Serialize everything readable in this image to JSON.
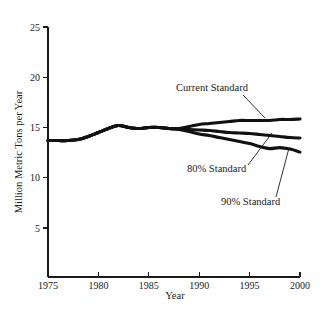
{
  "chart_data": {
    "type": "line",
    "title": "",
    "xlabel": "Year",
    "ylabel": "Million Metric Tons per Year",
    "xlim": [
      1975,
      2000
    ],
    "ylim": [
      0,
      25
    ],
    "grid": false,
    "legend_position": "inline-annotations",
    "x_ticks": [
      1975,
      1980,
      1985,
      1990,
      1995,
      2000
    ],
    "x_tick_labels": [
      "1975",
      "1980",
      "1985",
      "1990",
      "1995",
      "2000"
    ],
    "y_ticks": [
      5,
      10,
      15,
      20,
      25
    ],
    "y_tick_labels": [
      "5",
      "10",
      "15",
      "20",
      "25"
    ],
    "x": [
      1975,
      1976,
      1977,
      1978,
      1979,
      1980,
      1981,
      1982,
      1983,
      1984,
      1985,
      1986,
      1987,
      1988,
      1989,
      1990,
      1991,
      1992,
      1993,
      1994,
      1995,
      1996,
      1997,
      1998,
      1999,
      2000
    ],
    "series": [
      {
        "name": "Current Standard",
        "label": "Current Standard",
        "values": [
          13.7,
          13.7,
          13.7,
          13.8,
          14.1,
          14.5,
          14.9,
          15.2,
          15.0,
          14.9,
          15.0,
          15.0,
          14.9,
          14.9,
          15.1,
          15.3,
          15.4,
          15.5,
          15.6,
          15.7,
          15.7,
          15.7,
          15.7,
          15.8,
          15.8,
          15.85
        ]
      },
      {
        "name": "80% Standard",
        "label": "80% Standard",
        "values": [
          13.7,
          13.7,
          13.7,
          13.8,
          14.1,
          14.5,
          14.9,
          15.2,
          15.0,
          14.9,
          15.0,
          15.0,
          14.9,
          14.85,
          14.8,
          14.75,
          14.7,
          14.6,
          14.5,
          14.45,
          14.4,
          14.3,
          14.2,
          14.1,
          14.0,
          13.95
        ]
      },
      {
        "name": "90% Standard",
        "label": "90% Standard",
        "values": [
          13.7,
          13.7,
          13.7,
          13.8,
          14.1,
          14.5,
          14.9,
          15.2,
          15.0,
          14.9,
          15.0,
          15.0,
          14.9,
          14.8,
          14.6,
          14.35,
          14.2,
          14.0,
          13.8,
          13.6,
          13.4,
          13.1,
          12.9,
          13.0,
          12.85,
          12.55
        ]
      }
    ],
    "annotations": [
      {
        "text": "Current Standard",
        "text_x": 176,
        "text_y": 91,
        "leader": [
          [
            243,
            95
          ],
          [
            265,
            118
          ]
        ]
      },
      {
        "text": "80% Standard",
        "text_x": 187,
        "text_y": 172,
        "leader": [
          [
            248,
            165
          ],
          [
            272,
            133
          ]
        ]
      },
      {
        "text": "90% Standard",
        "text_x": 221,
        "text_y": 205,
        "leader": [
          [
            276,
            197
          ],
          [
            289,
            148
          ]
        ]
      }
    ]
  },
  "colors": {
    "line": "#111111",
    "axis": "#1a1a1a",
    "background": "#ffffff"
  }
}
